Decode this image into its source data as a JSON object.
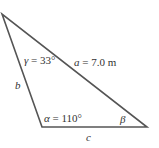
{
  "diagram": {
    "type": "triangle",
    "stroke_color": "#555555",
    "vertices": {
      "top": [
        2,
        14
      ],
      "bottom_left": [
        42,
        127
      ],
      "bottom_right": [
        147,
        127
      ]
    },
    "labels": {
      "gamma": {
        "symbol": "γ",
        "value": " = 33°"
      },
      "a": {
        "symbol": "a",
        "value": " = 7.0 m"
      },
      "b": {
        "symbol": "b"
      },
      "alpha": {
        "symbol": "α",
        "value": " = 110°"
      },
      "beta": {
        "symbol": "β"
      },
      "c": {
        "symbol": "c"
      }
    }
  }
}
